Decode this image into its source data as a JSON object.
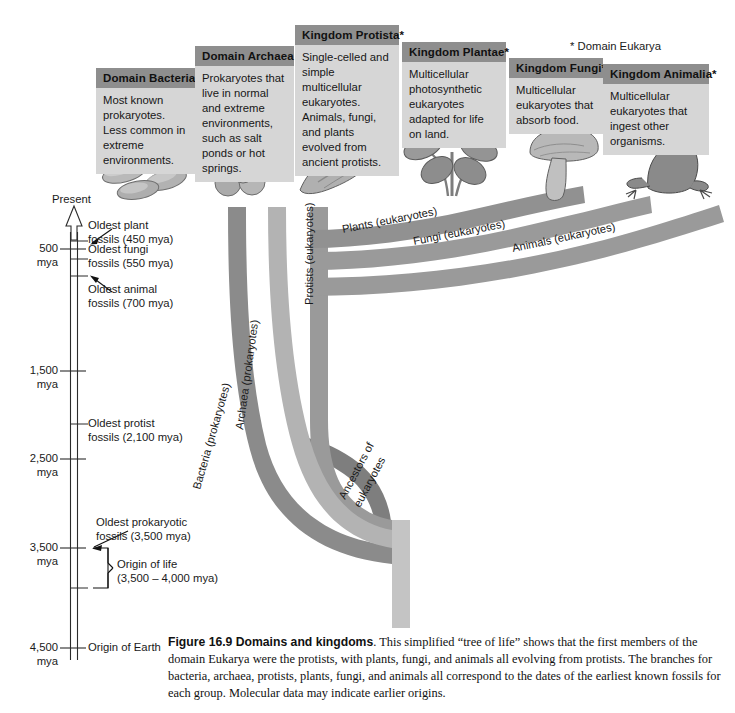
{
  "figure": {
    "number": "Figure 16.9",
    "title": "Domains and kingdoms",
    "caption_body": ". This simplified “tree of life” shows that the first members of the domain Eukarya were the protists, with plants, fungi, and animals all evolving from protists. The branches for bacteria, archaea, protists, plants, fungi, and animals all correspond to the dates of the earliest known fossils for each group. Molecular data may indicate earlier origins.",
    "footnote": "* Domain Eukarya"
  },
  "cards": [
    {
      "id": "bacteria",
      "title": "Domain Bacteria",
      "body": "Most known prokaryotes. Less common in extreme environments.",
      "organism_icon": "rod-bacteria-icon"
    },
    {
      "id": "archaea",
      "title": "Domain Archaea",
      "body": "Prokaryotes that live in normal and extreme environments, such as salt ponds or hot springs.",
      "organism_icon": "cocci-cluster-icon"
    },
    {
      "id": "protista",
      "title": "Kingdom Protista*",
      "body": "Single-celled and simple multicellular eukaryotes. Animals, fungi, and plants evolved from ancient protists.",
      "organism_icon": "flagellate-protist-icon"
    },
    {
      "id": "plantae",
      "title": "Kingdom Plantae*",
      "body": "Multicellular photosynthetic eukaryotes adapted for life on land.",
      "organism_icon": "flowering-plant-icon"
    },
    {
      "id": "fungi",
      "title": "Kingdom Fungi*",
      "body": "Multicellular eukaryotes that absorb food.",
      "organism_icon": "mushroom-icon"
    },
    {
      "id": "animalia",
      "title": "Kingdom Animalia*",
      "body": "Multicellular eukaryotes that ingest other organisms.",
      "organism_icon": "frog-icon"
    }
  ],
  "timeline": {
    "top_label": "Present",
    "axis_ticks": [
      {
        "id": "t500",
        "label": "500\nmya"
      },
      {
        "id": "t1500",
        "label": "1,500\nmya"
      },
      {
        "id": "t2500",
        "label": "2,500\nmya"
      },
      {
        "id": "t3500",
        "label": "3,500\nmya"
      },
      {
        "id": "t4500",
        "label": "4,500\nmya"
      }
    ],
    "tick_500": "500",
    "tick_500_unit": "mya",
    "tick_1500": "1,500",
    "tick_1500_unit": "mya",
    "tick_2500": "2,500",
    "tick_2500_unit": "mya",
    "tick_3500": "3,500",
    "tick_3500_unit": "mya",
    "tick_4500": "4,500",
    "tick_4500_unit": "mya",
    "events": [
      {
        "id": "plant_fossils",
        "line1": "Oldest plant",
        "line2": "fossils (450 mya)"
      },
      {
        "id": "fungi_fossils",
        "line1": "Oldest fungi",
        "line2": "fossils (550 mya)"
      },
      {
        "id": "animal_fossils",
        "line1": "Oldest animal",
        "line2": "fossils (700 mya)"
      },
      {
        "id": "protist_fossils",
        "line1": "Oldest protist",
        "line2": "fossils (2,100 mya)"
      },
      {
        "id": "prokaryotic_fossils",
        "line1": "Oldest prokaryotic",
        "line2": "fossils (3,500 mya)"
      },
      {
        "id": "origin_of_life",
        "line1": "Origin of life",
        "line2": "(3,500 – 4,000 mya)"
      }
    ],
    "origin_of_earth": "Origin of Earth"
  },
  "branches": [
    {
      "id": "bacteria",
      "label": "Bacteria (prokaryotes)",
      "color": "#8b8b8b"
    },
    {
      "id": "archaea",
      "label": "Archaea (prokaryotes)",
      "color": "#b3b3b3"
    },
    {
      "id": "protists",
      "label": "Protists (eukaryotes)",
      "color": "#9a9a9a"
    },
    {
      "id": "plants",
      "label": "Plants (eukaryotes)",
      "color": "#919191"
    },
    {
      "id": "fungi",
      "label": "Fungi (eukaryotes)",
      "color": "#9a9a9a"
    },
    {
      "id": "animals",
      "label": "Animals (eukaryotes)",
      "color": "#9a9a9a"
    },
    {
      "id": "ancestors",
      "label": "Ancestors of eukaryotes",
      "color": "#7e7e7e"
    }
  ],
  "branch_labels": {
    "bacteria": "Bacteria (prokaryotes)",
    "archaea": "Archaea (prokaryotes)",
    "protists": "Protists (eukaryotes)",
    "plants": "Plants (eukaryotes)",
    "fungi": "Fungi (eukaryotes)",
    "animals": "Animals (eukaryotes)",
    "ancestors_l1": "Ancestors of",
    "ancestors_l2": "eukaryotes"
  },
  "colors": {
    "card_header": "#8e8e8e",
    "card_body": "#d6d6d6",
    "branch_dark": "#7e7e7e",
    "branch_mid": "#9a9a9a",
    "branch_light": "#b3b3b3",
    "trunk_light": "#c4c4c4",
    "axis": "#2b2b2b"
  }
}
